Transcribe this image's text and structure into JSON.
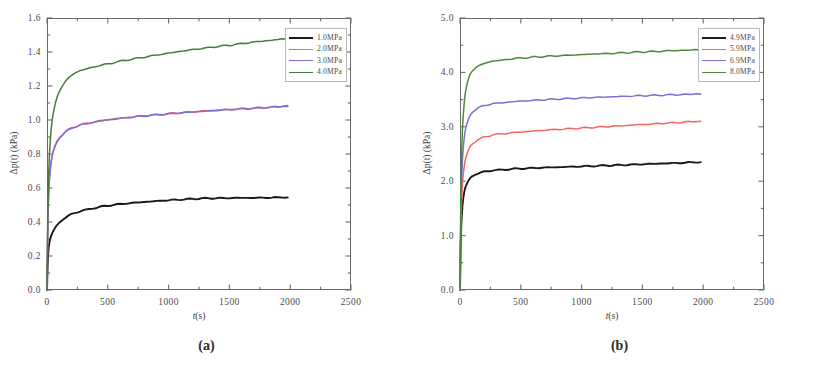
{
  "figure": {
    "panels": [
      {
        "caption": "(a)",
        "axes": {
          "xlabel_italic": "t",
          "xlabel_rest": "(s)",
          "ylabel": "Δp(t) (kPa)",
          "xticks": [
            0,
            500,
            1000,
            1500,
            2000,
            2500
          ],
          "xtick_labels": [
            "0",
            "500",
            "1000",
            "1500",
            "2000",
            "2500"
          ],
          "yticks": [
            0.0,
            0.2,
            0.4,
            0.6,
            0.8,
            1.0,
            1.2,
            1.4,
            1.6
          ],
          "ytick_labels": [
            "0.0",
            "0.2",
            "0.4",
            "0.6",
            "0.8",
            "1.0",
            "1.2",
            "1.4",
            "1.6"
          ],
          "xlim": [
            0,
            2500
          ],
          "ylim": [
            0.0,
            1.6
          ],
          "minor_ticks_per_interval": 1,
          "grid": false
        },
        "legend": {
          "position": "top-right",
          "entries": [
            {
              "label": "1.0MPa",
              "color": "#1a1a1a"
            },
            {
              "label": "2.0MPa",
              "color": "#f4655c"
            },
            {
              "label": "3.0MPa",
              "color": "#7b6fd6"
            },
            {
              "label": "4.0MPa",
              "color": "#4a7a3a"
            }
          ]
        }
      },
      {
        "caption": "(b)",
        "axes": {
          "xlabel_italic": "t",
          "xlabel_rest": "(s)",
          "ylabel": "Δp(t) (kPa)",
          "xticks": [
            0,
            500,
            1000,
            1500,
            2000,
            2500
          ],
          "xtick_labels": [
            "0",
            "500",
            "1000",
            "1500",
            "2000",
            "2500"
          ],
          "yticks": [
            0.0,
            1.0,
            2.0,
            3.0,
            4.0,
            5.0
          ],
          "ytick_labels": [
            "0.0",
            "1.0",
            "2.0",
            "3.0",
            "4.0",
            "5.0"
          ],
          "xlim": [
            0,
            2500
          ],
          "ylim": [
            0.0,
            5.0
          ],
          "minor_ticks_per_interval": 1,
          "grid": false
        },
        "legend": {
          "position": "top-right",
          "entries": [
            {
              "label": "4.9MPa",
              "color": "#1a1a1a"
            },
            {
              "label": "5.9MPa",
              "color": "#f4655c"
            },
            {
              "label": "6.9MPa",
              "color": "#7b6fd6"
            },
            {
              "label": "8.0MPa",
              "color": "#4a8a3a"
            }
          ]
        }
      }
    ]
  },
  "chart_data": [
    {
      "type": "line",
      "title": "(a)",
      "xlabel": "t(s)",
      "ylabel": "Δp(t) (kPa)",
      "xlim": [
        0,
        2500
      ],
      "ylim": [
        0.0,
        1.6
      ],
      "grid": false,
      "legend_position": "top-right",
      "x": [
        0,
        5,
        10,
        20,
        35,
        50,
        75,
        100,
        150,
        200,
        250,
        300,
        400,
        500,
        600,
        700,
        800,
        900,
        1000,
        1100,
        1200,
        1300,
        1400,
        1500,
        1600,
        1700,
        1800,
        1900,
        1980
      ],
      "series": [
        {
          "name": "1.0MPa",
          "color": "#1a1a1a",
          "values": [
            0.0,
            0.14,
            0.22,
            0.28,
            0.32,
            0.345,
            0.375,
            0.395,
            0.425,
            0.445,
            0.458,
            0.468,
            0.484,
            0.496,
            0.505,
            0.512,
            0.518,
            0.523,
            0.528,
            0.532,
            0.536,
            0.539,
            0.54,
            0.541,
            0.542,
            0.542,
            0.543,
            0.544,
            0.545
          ]
        },
        {
          "name": "2.0MPa",
          "color": "#f4655c",
          "values": [
            0.0,
            0.3,
            0.5,
            0.66,
            0.76,
            0.815,
            0.865,
            0.895,
            0.93,
            0.952,
            0.966,
            0.976,
            0.991,
            1.002,
            1.01,
            1.018,
            1.025,
            1.031,
            1.037,
            1.043,
            1.048,
            1.053,
            1.058,
            1.062,
            1.066,
            1.07,
            1.074,
            1.078,
            1.085
          ]
        },
        {
          "name": "3.0MPa",
          "color": "#7b6fd6",
          "values": [
            0.0,
            0.29,
            0.49,
            0.65,
            0.755,
            0.81,
            0.86,
            0.89,
            0.927,
            0.95,
            0.964,
            0.974,
            0.989,
            1.0,
            1.009,
            1.017,
            1.024,
            1.03,
            1.036,
            1.042,
            1.047,
            1.052,
            1.057,
            1.061,
            1.065,
            1.069,
            1.073,
            1.077,
            1.079
          ]
        },
        {
          "name": "4.0MPa",
          "color": "#4a7a3a",
          "values": [
            0.0,
            0.34,
            0.58,
            0.8,
            0.95,
            1.035,
            1.115,
            1.165,
            1.225,
            1.262,
            1.283,
            1.296,
            1.315,
            1.33,
            1.345,
            1.358,
            1.37,
            1.382,
            1.393,
            1.404,
            1.414,
            1.423,
            1.432,
            1.44,
            1.449,
            1.458,
            1.466,
            1.473,
            1.478
          ]
        }
      ]
    },
    {
      "type": "line",
      "title": "(b)",
      "xlabel": "t(s)",
      "ylabel": "Δp(t) (kPa)",
      "xlim": [
        0,
        2500
      ],
      "ylim": [
        0.0,
        5.0
      ],
      "grid": false,
      "legend_position": "top-right",
      "x": [
        0,
        5,
        10,
        20,
        35,
        50,
        75,
        100,
        150,
        200,
        250,
        300,
        400,
        500,
        600,
        700,
        800,
        900,
        1000,
        1100,
        1200,
        1300,
        1400,
        1500,
        1600,
        1700,
        1800,
        1900,
        1980
      ],
      "series": [
        {
          "name": "4.9MPa",
          "color": "#1a1a1a",
          "values": [
            0.0,
            0.7,
            1.15,
            1.55,
            1.8,
            1.92,
            2.03,
            2.09,
            2.145,
            2.175,
            2.192,
            2.203,
            2.22,
            2.232,
            2.242,
            2.25,
            2.258,
            2.265,
            2.272,
            2.28,
            2.288,
            2.296,
            2.304,
            2.312,
            2.32,
            2.328,
            2.336,
            2.344,
            2.35
          ]
        },
        {
          "name": "5.9MPa",
          "color": "#f4655c",
          "values": [
            0.0,
            0.85,
            1.42,
            1.95,
            2.28,
            2.45,
            2.6,
            2.68,
            2.765,
            2.81,
            2.84,
            2.86,
            2.885,
            2.905,
            2.922,
            2.937,
            2.951,
            2.964,
            2.977,
            2.99,
            3.003,
            3.016,
            3.029,
            3.042,
            3.055,
            3.068,
            3.08,
            3.092,
            3.1
          ]
        },
        {
          "name": "6.9MPa",
          "color": "#7b6fd6",
          "values": [
            0.0,
            1.05,
            1.75,
            2.4,
            2.8,
            3.0,
            3.17,
            3.26,
            3.345,
            3.39,
            3.415,
            3.432,
            3.455,
            3.472,
            3.486,
            3.498,
            3.509,
            3.519,
            3.529,
            3.539,
            3.548,
            3.556,
            3.564,
            3.572,
            3.579,
            3.586,
            3.592,
            3.597,
            3.6
          ]
        },
        {
          "name": "8.0MPa",
          "color": "#4a8a3a",
          "values": [
            0.0,
            1.28,
            2.15,
            2.95,
            3.45,
            3.7,
            3.92,
            4.02,
            4.115,
            4.165,
            4.195,
            4.215,
            4.243,
            4.263,
            4.279,
            4.293,
            4.305,
            4.316,
            4.327,
            4.337,
            4.347,
            4.357,
            4.367,
            4.376,
            4.385,
            4.394,
            4.402,
            4.41,
            4.415
          ]
        }
      ]
    }
  ]
}
